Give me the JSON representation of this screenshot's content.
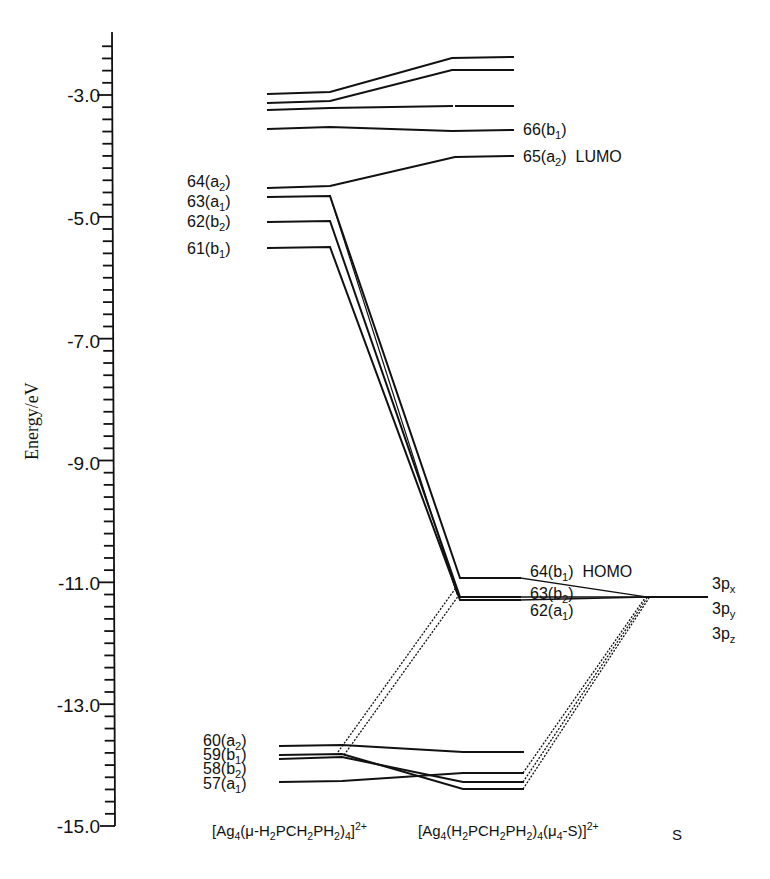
{
  "chart_data": {
    "type": "diagram",
    "subtype": "molecular-orbital-correlation-diagram",
    "ylabel": "Energy/eV",
    "ylim": [
      -15.0,
      -2.0
    ],
    "yticks_major": [
      "-3.0",
      "-5.0",
      "-7.0",
      "-9.0",
      "-11.0",
      "-13.0",
      "-15.0"
    ],
    "ytick_minor_step": 0.2,
    "columns": [
      {
        "id": "left",
        "label_html": "[Ag<sub>4</sub>(&mu;-H<sub>2</sub>PCH<sub>2</sub>PH<sub>2</sub>)<sub>4</sub>]<sup>2+</sup>",
        "label": "[Ag4(μ-H2PCH2PH2)4]2+"
      },
      {
        "id": "middle",
        "label": "[Ag4(H2PCH2PH2)4(μ4-S)]2+"
      },
      {
        "id": "right",
        "label": "S"
      }
    ],
    "levels": {
      "left": [
        {
          "energy": -2.98,
          "label": ""
        },
        {
          "energy": -3.13,
          "label": ""
        },
        {
          "energy": -3.24,
          "label": ""
        },
        {
          "energy": -3.55,
          "label": ""
        },
        {
          "energy": -4.51,
          "label": "64(a2)"
        },
        {
          "energy": -4.66,
          "label": "63(a1)"
        },
        {
          "energy": -5.07,
          "label": "62(b2)"
        },
        {
          "energy": -5.49,
          "label": "61(b1)"
        },
        {
          "energy": -13.59,
          "label": "60(a2)"
        },
        {
          "energy": -13.73,
          "label": "59(b1)"
        },
        {
          "energy": -13.8,
          "label": "58(b2)"
        },
        {
          "energy": -14.17,
          "label": "57(a1)"
        }
      ],
      "middle": [
        {
          "energy": -2.38,
          "label": ""
        },
        {
          "energy": -2.59,
          "label": ""
        },
        {
          "energy": -3.18,
          "label": ""
        },
        {
          "energy": -3.57,
          "label": "66(b1)"
        },
        {
          "energy": -3.99,
          "label": "65(a2) LUMO"
        },
        {
          "energy": -10.85,
          "label": "64(b1) HOMO"
        },
        {
          "energy": -11.16,
          "label": "63(b2)"
        },
        {
          "energy": -11.21,
          "label": "62(a1)"
        },
        {
          "energy": -13.68,
          "label": ""
        },
        {
          "energy": -14.02,
          "label": ""
        },
        {
          "energy": -14.17,
          "label": ""
        },
        {
          "energy": -14.28,
          "label": ""
        }
      ],
      "right": [
        {
          "energy": -11.16,
          "label": "3px 3py 3pz"
        }
      ]
    }
  },
  "axis": {
    "ylabel": "Energy/eV",
    "ticks": [
      {
        "label": "-3.0",
        "y": 95
      },
      {
        "label": "-5.0",
        "y": 218
      },
      {
        "label": "-7.0",
        "y": 341
      },
      {
        "label": "-9.0",
        "y": 463
      },
      {
        "label": "-11.0",
        "y": 583
      },
      {
        "label": "-13.0",
        "y": 705
      },
      {
        "label": "-15.0",
        "y": 826
      }
    ]
  },
  "labels": {
    "left_upper": {
      "l64": "64(a",
      "l64s": "2",
      "l63": "63(a",
      "l63s": "1",
      "l62": "62(b",
      "l62s": "2",
      "l61": "61(b",
      "l61s": "1"
    },
    "left_lower": {
      "l60": "60(a",
      "l60s": "2",
      "l59": "59(b",
      "l59s": "1",
      "l58": "58(b",
      "l58s": "2",
      "l57": "57(a",
      "l57s": "1"
    },
    "middle_upper": {
      "l66": "66(b",
      "l66s": "1",
      "l65": "65(a",
      "l65s": "2",
      "lumo": "LUMO"
    },
    "middle_homo": {
      "l64": "64(b",
      "l64s": "1",
      "homo": "HOMO",
      "l63": "63(b",
      "l63s": "2",
      "l62": "62(a",
      "l62s": "1"
    },
    "s_orbitals": {
      "p": "3p",
      "x": "x",
      "y": "y",
      "z": "z"
    },
    "close": ")"
  },
  "xlabels": {
    "left": {
      "a": "[Ag",
      "b": "4",
      "c": "(μ-H",
      "d": "2",
      "e": "PCH",
      "f": "2",
      "g": "PH",
      "h": "2",
      "i": ")",
      "j": "4",
      "k": "]",
      "l": "2+"
    },
    "middle": {
      "a": "[Ag",
      "b": "4",
      "c": "(H",
      "d": "2",
      "e": "PCH",
      "f": "2",
      "g": "PH",
      "h": "2",
      "i": ")",
      "j": "4",
      "k": "(μ",
      "l": "4",
      "m": "-S)]",
      "n": "2+"
    },
    "right": "S"
  }
}
